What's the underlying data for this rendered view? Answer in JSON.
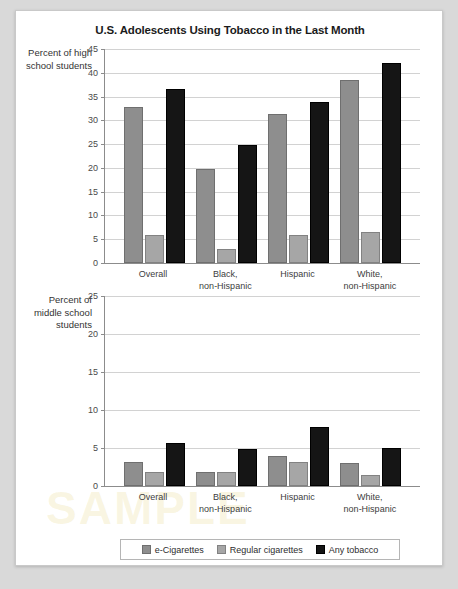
{
  "figure": {
    "title": "U.S. Adolescents Using Tobacco in the Last Month",
    "source_note": "Data from Wang et al., 2018.",
    "watermark": "SAMPLE"
  },
  "legend": {
    "items": [
      {
        "label": "e-Cigarettes",
        "color": "#8e8e8e",
        "key": "ecig"
      },
      {
        "label": "Regular cigarettes",
        "color": "#a6a6a6",
        "key": "reg"
      },
      {
        "label": "Any tobacco",
        "color": "#151515",
        "key": "any"
      }
    ]
  },
  "chart_data": [
    {
      "type": "bar",
      "title": "U.S. Adolescents Using Tobacco in the Last Month",
      "panel": "high-school",
      "ylabel": "Percent of high school students",
      "xlabel": "",
      "ylim": [
        0,
        45
      ],
      "yticks": [
        0,
        5,
        10,
        15,
        20,
        25,
        30,
        35,
        40,
        45
      ],
      "grid": true,
      "legend_position": "bottom",
      "categories": [
        "Overall",
        "Black, non-Hispanic",
        "Hispanic",
        "White, non-Hispanic"
      ],
      "series": [
        {
          "name": "e-Cigarettes",
          "color": "#8e8e8e",
          "values": [
            32.8,
            19.8,
            31.4,
            38.5
          ]
        },
        {
          "name": "Regular cigarettes",
          "color": "#a6a6a6",
          "values": [
            5.9,
            3.0,
            5.9,
            6.6
          ]
        },
        {
          "name": "Any tobacco",
          "color": "#151515",
          "values": [
            36.5,
            24.8,
            33.9,
            42.0
          ]
        }
      ]
    },
    {
      "type": "bar",
      "panel": "middle-school",
      "ylabel": "Percent of middle school students",
      "xlabel": "",
      "ylim": [
        0,
        25
      ],
      "yticks": [
        0,
        5,
        10,
        15,
        20,
        25
      ],
      "grid": true,
      "legend_position": "bottom",
      "categories": [
        "Overall",
        "Black, non-Hispanic",
        "Hispanic",
        "White, non-Hispanic"
      ],
      "series": [
        {
          "name": "e-Cigarettes",
          "color": "#8e8e8e",
          "values": [
            3.1,
            1.9,
            3.9,
            3.0
          ]
        },
        {
          "name": "Regular cigarettes",
          "color": "#a6a6a6",
          "values": [
            1.8,
            1.9,
            3.2,
            1.5
          ]
        },
        {
          "name": "Any tobacco",
          "color": "#151515",
          "values": [
            5.6,
            4.9,
            7.7,
            5.0
          ]
        }
      ]
    }
  ]
}
